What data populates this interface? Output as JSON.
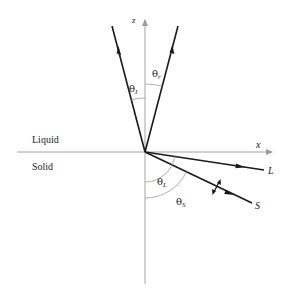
{
  "diagram": {
    "axes": {
      "z_label": "z",
      "x_label": "x"
    },
    "regions": {
      "upper": "Liquid",
      "lower": "Solid"
    },
    "rays": [
      {
        "id": "incident",
        "label": "",
        "direction": "toward origin"
      },
      {
        "id": "reflected",
        "label": "",
        "direction": "away from origin"
      },
      {
        "id": "longitudinal",
        "label": "L",
        "direction": "away from origin"
      },
      {
        "id": "shear",
        "label": "S",
        "direction": "away from origin",
        "polarization": "transverse double arrow"
      }
    ],
    "angles": {
      "incident": {
        "symbol": "θ",
        "subscript": "I"
      },
      "reflected": {
        "symbol": "θ",
        "subscript": "r"
      },
      "longitudinal": {
        "symbol": "θ",
        "subscript": "L"
      },
      "shear": {
        "symbol": "θ",
        "subscript": "S"
      }
    },
    "colors": {
      "ray": "#1a1a1a",
      "axis": "#9a9a9a",
      "background": "#ffffff"
    }
  }
}
